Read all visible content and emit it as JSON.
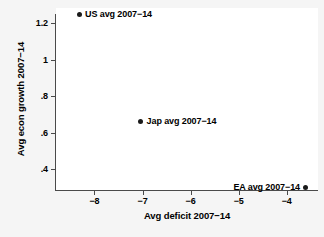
{
  "chart_data": {
    "type": "scatter",
    "title": "",
    "xlabel": "Avg deficit 2007−14",
    "ylabel": "Avg econ growth 2007−14",
    "xlim": [
      -8.8,
      -3.35
    ],
    "ylim": [
      0.285,
      1.285
    ],
    "grid": false,
    "legend": "none",
    "xticks": [
      {
        "value": -8,
        "label": "−8"
      },
      {
        "value": -7,
        "label": "−7"
      },
      {
        "value": -6,
        "label": "−6"
      },
      {
        "value": -5,
        "label": "−5"
      },
      {
        "value": -4,
        "label": "−4"
      }
    ],
    "yticks": [
      {
        "value": 0.4,
        "label": ".4"
      },
      {
        "value": 0.6,
        "label": ".6"
      },
      {
        "value": 0.8,
        "label": ".8"
      },
      {
        "value": 1.0,
        "label": "1"
      },
      {
        "value": 1.2,
        "label": "1.2"
      }
    ],
    "points": [
      {
        "name": "US",
        "label": "US avg 2007−14",
        "x": -8.32,
        "y": 1.25,
        "label_side": "right"
      },
      {
        "name": "Jap",
        "label": "Jap avg 2007−14",
        "x": -7.04,
        "y": 0.66,
        "label_side": "right"
      },
      {
        "name": "EA",
        "label": "EA avg 2007−14",
        "x": -3.6,
        "y": 0.3,
        "label_side": "left"
      }
    ],
    "marker_color": "#1a1a1a",
    "axis_color": "#4a4a4a",
    "plot_background": "#ffffff",
    "figure_background": "#f5f5f5"
  }
}
